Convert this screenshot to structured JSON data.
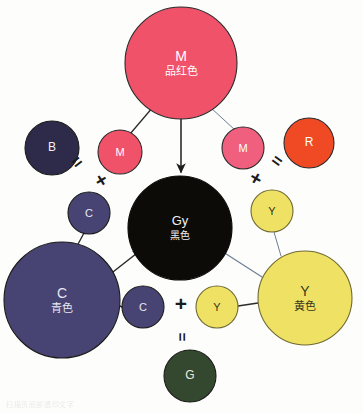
{
  "figure": {
    "background_color": "#fdfdfb"
  },
  "chart_data": {
    "type": "diagram",
    "nodes": [
      {
        "id": "M-big",
        "letter": "M",
        "cn": "品红色",
        "x": 181,
        "y": 63,
        "r": 56,
        "fill": "#ef5269",
        "stroke": "#2a2a2a",
        "text_color": "#ffffff",
        "font_size": 14
      },
      {
        "id": "B",
        "letter": "B",
        "cn": "",
        "x": 52,
        "y": 148,
        "r": 27,
        "fill": "#2e2a49",
        "stroke": "#1a1a1a",
        "text_color": "#f2f2f2",
        "font_size": 12
      },
      {
        "id": "M-left",
        "letter": "M",
        "cn": "",
        "x": 120,
        "y": 152,
        "r": 22,
        "fill": "#ef5269",
        "stroke": "#2a2a2a",
        "text_color": "#ffffff",
        "font_size": 11
      },
      {
        "id": "M-right",
        "letter": "M",
        "cn": "",
        "x": 243,
        "y": 148,
        "r": 21,
        "fill": "#f05f7d",
        "stroke": "#2a2a2a",
        "text_color": "#ffffff",
        "font_size": 11
      },
      {
        "id": "R",
        "letter": "R",
        "cn": "",
        "x": 309,
        "y": 143,
        "r": 25,
        "fill": "#f04a24",
        "stroke": "#2a2a2a",
        "text_color": "#ffffff",
        "font_size": 12
      },
      {
        "id": "C-up",
        "letter": "C",
        "cn": "",
        "x": 89,
        "y": 213,
        "r": 21,
        "fill": "#474473",
        "stroke": "#1a1a1a",
        "text_color": "#e8e8f4",
        "font_size": 11
      },
      {
        "id": "Y-up",
        "letter": "Y",
        "cn": "",
        "x": 272,
        "y": 211,
        "r": 21,
        "fill": "#efe163",
        "stroke": "#6f6a33",
        "text_color": "#3a3520",
        "font_size": 11
      },
      {
        "id": "Gy",
        "letter": "Gy",
        "cn": "黑色",
        "x": 180,
        "y": 228,
        "r": 52,
        "fill": "#0d0b08",
        "stroke": "#0a0908",
        "text_color": "#f0f0f0",
        "font_size": 13
      },
      {
        "id": "C-big",
        "letter": "C",
        "cn": "青色",
        "x": 62,
        "y": 300,
        "r": 58,
        "fill": "#474473",
        "stroke": "#1a1a1a",
        "text_color": "#e8e8f4",
        "font_size": 14
      },
      {
        "id": "Y-big",
        "letter": "Y",
        "cn": "黄色",
        "x": 305,
        "y": 298,
        "r": 47,
        "fill": "#efe163",
        "stroke": "#6f6a33",
        "text_color": "#3a3520",
        "font_size": 14
      },
      {
        "id": "C-low",
        "letter": "C",
        "cn": "",
        "x": 143,
        "y": 307,
        "r": 21,
        "fill": "#474473",
        "stroke": "#1a1a1a",
        "text_color": "#e8e8f4",
        "font_size": 11
      },
      {
        "id": "Y-low",
        "letter": "Y",
        "cn": "",
        "x": 217,
        "y": 307,
        "r": 21,
        "fill": "#efe163",
        "stroke": "#6f6a33",
        "text_color": "#3a3520",
        "font_size": 11
      },
      {
        "id": "G",
        "letter": "G",
        "cn": "",
        "x": 190,
        "y": 376,
        "r": 26,
        "fill": "#34482f",
        "stroke": "#1a1a1a",
        "text_color": "#eaeae0",
        "font_size": 12
      }
    ],
    "edges": [
      {
        "from": "M-big",
        "to": "M-left",
        "x1": 153,
        "y1": 107,
        "x2": 130,
        "y2": 134,
        "color": "#2b2b2b",
        "width": 1.3,
        "arrow": false
      },
      {
        "from": "M-big",
        "to": "M-right",
        "x1": 210,
        "y1": 107,
        "x2": 235,
        "y2": 130,
        "color": "#6d7f92",
        "width": 1.0,
        "arrow": false
      },
      {
        "from": "M-big",
        "to": "Gy",
        "x1": 181,
        "y1": 119,
        "x2": 181,
        "y2": 172,
        "color": "#2b2b2b",
        "width": 1.6,
        "arrow": true
      },
      {
        "from": "C-big",
        "to": "C-up",
        "x1": 77,
        "y1": 246,
        "x2": 84,
        "y2": 233,
        "color": "#2b2b2b",
        "width": 1.4,
        "arrow": false
      },
      {
        "from": "C-big",
        "to": "Gy",
        "x1": 104,
        "y1": 279,
        "x2": 141,
        "y2": 250,
        "color": "#2b2b2b",
        "width": 1.5,
        "arrow": true
      },
      {
        "from": "C-big",
        "to": "C-low",
        "x1": 120,
        "y1": 306,
        "x2": 122,
        "y2": 307,
        "color": "#2b2b2b",
        "width": 1.4,
        "arrow": false
      },
      {
        "from": "Y-big",
        "to": "Y-up",
        "x1": 281,
        "y1": 256,
        "x2": 274,
        "y2": 232,
        "color": "#6d7f92",
        "width": 1.0,
        "arrow": false
      },
      {
        "from": "Y-big",
        "to": "Gy",
        "x1": 262,
        "y1": 277,
        "x2": 220,
        "y2": 250,
        "color": "#6d8096",
        "width": 1.2,
        "arrow": true
      },
      {
        "from": "Y-big",
        "to": "Y-low",
        "x1": 258,
        "y1": 303,
        "x2": 238,
        "y2": 306,
        "color": "#2b2b2b",
        "width": 1.4,
        "arrow": false
      }
    ],
    "operators": [
      {
        "symbol": "=",
        "x": 77,
        "y": 162,
        "rotation": -38,
        "size": 17
      },
      {
        "symbol": "+",
        "x": 101,
        "y": 180,
        "rotation": -32,
        "size": 20
      },
      {
        "symbol": "+",
        "x": 256,
        "y": 178,
        "rotation": 30,
        "size": 20
      },
      {
        "symbol": "=",
        "x": 277,
        "y": 161,
        "rotation": 36,
        "size": 17
      },
      {
        "symbol": "+",
        "x": 181,
        "y": 303,
        "rotation": 0,
        "size": 21
      },
      {
        "symbol": "=",
        "x": 182,
        "y": 337,
        "rotation": 90,
        "size": 15
      }
    ],
    "equations": [
      "B = M + C",
      "R = M + Y",
      "G = C + Y",
      "Gy (黑色) = M + C + Y"
    ],
    "legend": {
      "M": "品红色",
      "C": "青色",
      "Y": "黄色",
      "Gy": "黑色"
    }
  },
  "bleed_text": "扫描页底部透印文字"
}
